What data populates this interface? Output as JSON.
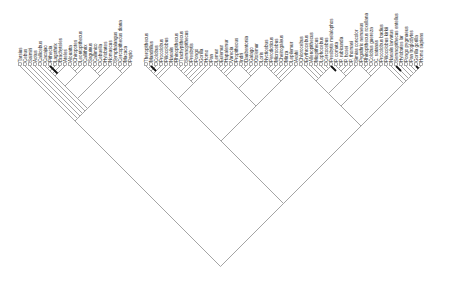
{
  "diagram": {
    "type": "cladogram",
    "orientation": "root-bottom, tips-top, diagonal branches",
    "branch_color": "#9a9a9a",
    "highlight_branch_color": "#111111",
    "root": {
      "x": 222,
      "y": 258
    },
    "tip_y": 66,
    "taxa": [
      "Tarsius",
      "Cebus",
      "Saimiri",
      "Aotus",
      "Callicebus",
      "Cacajao",
      "Pithecia",
      "Lagothrix",
      "Brachyteles",
      "Ateles",
      "Alouatta",
      "Chiropotes",
      "Leontopithecus",
      "Callithrix",
      "Saguinus",
      "Callimico",
      "Cebuella",
      "Hylobates",
      "Nomascus",
      "Symphalangus",
      "Cercopithecus diana",
      "Macaca",
      "Papio",
      "Theropithecus",
      "Mandrillus",
      "Colobus",
      "Procolobus",
      "Piliocolobus",
      "Nasalis",
      "Rhinopithecus",
      "Trachypithecus",
      "Semnopithecus",
      "Presbytis",
      "Pongo",
      "Gorilla",
      "Homo",
      "Pan",
      "Lemur",
      "Eulemur",
      "Hapalemur",
      "Varecia",
      "Propithecus",
      "Indri",
      "Daubentonia",
      "Galago",
      "Otolemur",
      "Loris",
      "Nycticebus",
      "Perodicticus",
      "Microcebus",
      "Cheirogaleus",
      "Mirza",
      "Lepilemur",
      "Avahi",
      "Chlorocebus",
      "Erythrocebus",
      "Allenopithecus",
      "Miopithecus",
      "Lophocebus",
      "Cercocebus",
      "Presbytis melalophos",
      "P. comata",
      "P. rubicunda",
      "P. hosei",
      "P. thomasi",
      "Simias concolor",
      "Pygathrix nemaeus",
      "Rhinopithecus roxellana",
      "Colobus guereza",
      "C. satanas",
      "Procolobus badius",
      "Piliocolobus kirkii",
      "Nasalis larvatus",
      "Semnopithecus entellus",
      "Hylobates lar",
      "Pongo pygmaeus",
      "Pan troglodytes",
      "Gorilla gorilla",
      "Homo sapiens"
    ],
    "tip_positions_x": [
      20,
      25,
      30,
      35,
      40,
      45,
      50,
      55,
      60,
      65,
      70,
      75,
      80,
      85,
      90,
      95,
      100,
      105,
      110,
      115,
      120,
      125,
      130,
      146,
      151,
      156,
      161,
      166,
      171,
      176,
      181,
      186,
      191,
      196,
      201,
      206,
      211,
      216,
      221,
      226,
      231,
      236,
      241,
      246,
      251,
      256,
      261,
      266,
      271,
      276,
      281,
      286,
      291,
      296,
      301,
      306,
      311,
      316,
      321,
      326,
      331,
      336,
      341,
      346,
      351,
      356,
      361,
      366,
      371,
      376,
      381,
      386,
      391,
      396,
      401,
      406,
      411,
      416,
      421
    ]
  }
}
